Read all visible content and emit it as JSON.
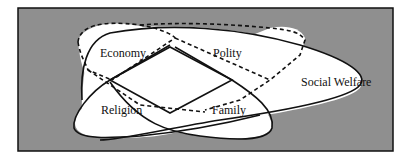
{
  "diagram": {
    "background_color": "#8f8f8f",
    "region_fill": "#ffffff",
    "line_color": "#111111",
    "sets": [
      {
        "name": "Economy",
        "outline": "dashed"
      },
      {
        "name": "Polity",
        "outline": "dashed"
      },
      {
        "name": "Religion",
        "outline": "solid"
      },
      {
        "name": "Family",
        "outline": "solid"
      },
      {
        "name": "Social Welfare",
        "outline": "solid"
      }
    ],
    "labels": {
      "economy": "Economy",
      "polity": "Polity",
      "religion": "Religion",
      "family": "Family",
      "social_welfare": "Social Welfare"
    }
  }
}
